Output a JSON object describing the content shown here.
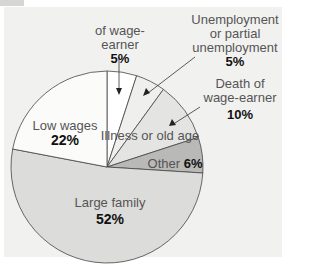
{
  "chart_data": {
    "type": "pie",
    "title": "",
    "slices": [
      {
        "label": "of wage-earner",
        "value": 5,
        "color": "#ffffff"
      },
      {
        "label": "Unemployment or partial unemployment",
        "value": 5,
        "color": "#efefed"
      },
      {
        "label": "Death of wage-earner",
        "value": 10,
        "color": "#e4e4e2"
      },
      {
        "label": "Other",
        "value": 6,
        "color": "#b9b9b7"
      },
      {
        "label": "Large family",
        "value": 52,
        "color": "#dcdcda"
      },
      {
        "label": "Low wages",
        "value": 22,
        "color": "#fbfbfa"
      }
    ],
    "annotations": [
      "Illness or old age"
    ],
    "start_angle": "top, clockwise",
    "legend": "none (direct labels)"
  },
  "labels": {
    "wage_earner": {
      "text": "of wage-earner",
      "pct": "5%"
    },
    "unemployment": {
      "line1": "Unemployment",
      "line2": "or partial",
      "line3": "unemployment",
      "pct": "5%"
    },
    "death": {
      "line1": "Death of",
      "line2": "wage-earner",
      "pct": "10%"
    },
    "illness": {
      "text": "Illness or old age"
    },
    "other": {
      "text": "Other",
      "pct": "6%"
    },
    "low_wages": {
      "text": "Low wages",
      "pct": "22%"
    },
    "large_family": {
      "text": "Large family",
      "pct": "52%"
    }
  }
}
